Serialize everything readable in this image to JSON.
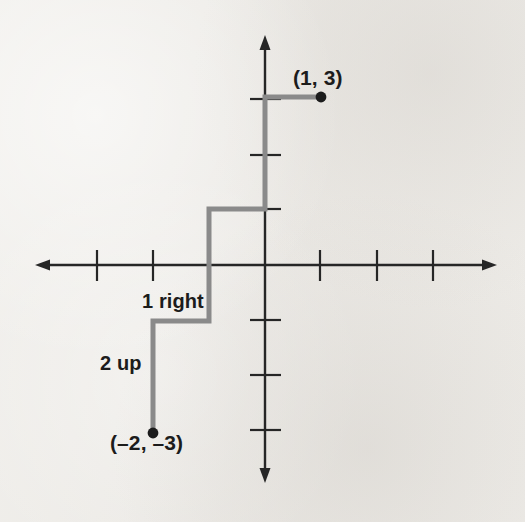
{
  "figure": {
    "kind": "coordinate-plane-diagram",
    "background_color": "#eceae6",
    "axis_color": "#262626",
    "path_color": "#8a8a8a",
    "point_color": "#1c1c1c",
    "label_color": "#1c1c1c"
  },
  "labels": {
    "point_a": "(1, 3)",
    "point_b": "(–2, –3)",
    "move_right": "1 right",
    "move_up": "2 up"
  },
  "chart_data": {
    "type": "scatter",
    "title": "",
    "xlabel": "",
    "ylabel": "",
    "xlim": [
      -4.1,
      4.1
    ],
    "ylim": [
      -4.1,
      4.1
    ],
    "grid": false,
    "legend": "none",
    "axes": {
      "x_axis": {
        "y_value": 0,
        "arrow_both_ends": true,
        "tick_values": [
          -3,
          -2,
          -1,
          1,
          2,
          3
        ],
        "tick_labels": [
          "",
          "",
          "",
          "",
          "",
          ""
        ]
      },
      "y_axis": {
        "x_value": 0,
        "arrow_both_ends": true,
        "tick_values": [
          3,
          2,
          1,
          -1,
          -2,
          -3
        ],
        "tick_labels": [
          "",
          "",
          "",
          "",
          "",
          ""
        ]
      },
      "unit_spacing_px": 56,
      "origin_px": {
        "x": 265,
        "y": 265
      }
    },
    "points": [
      {
        "name": "point_b",
        "label": "(–2, –3)",
        "x": -2,
        "y": -3
      },
      {
        "name": "point_a",
        "label": "(1, 3)",
        "x": 1,
        "y": 3
      }
    ],
    "staircase_path": {
      "description": "Slope staircase from (-2,-3) to (1,3): repeat 2 up then 1 right",
      "vertices": [
        {
          "x": -2,
          "y": -3
        },
        {
          "x": -2,
          "y": -1
        },
        {
          "x": -1,
          "y": -1
        },
        {
          "x": -1,
          "y": 1
        },
        {
          "x": 0,
          "y": 1
        },
        {
          "x": 0,
          "y": 3
        },
        {
          "x": 1,
          "y": 3
        }
      ],
      "annotations": [
        {
          "name": "move_right",
          "text": "1 right",
          "x": -2.1,
          "y": -0.55
        },
        {
          "name": "move_up",
          "text": "2 up",
          "x": -2.9,
          "y": -1.6
        }
      ]
    }
  }
}
